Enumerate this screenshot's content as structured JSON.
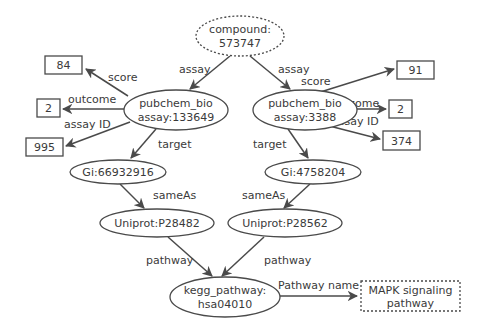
{
  "nodes": {
    "compound": {
      "line1": "compound:",
      "line2": "573747"
    },
    "left_assay": {
      "line1": "pubchem_bio",
      "line2": "assay:133649"
    },
    "right_assay": {
      "line1": "pubchem_bio",
      "line2": "assay:3388"
    },
    "left_score": "84",
    "left_outcome": "2",
    "left_assay_id": "995",
    "right_score": "91",
    "right_outcome": "2",
    "right_assay_id": "374",
    "left_gi": "Gi:66932916",
    "right_gi": "Gi:4758204",
    "left_uniprot": "Uniprot:P28482",
    "right_uniprot": "Uniprot:P28562",
    "kegg": {
      "line1": "kegg_pathway:",
      "line2": "hsa04010"
    },
    "pathway_name": {
      "line1": "MAPK signaling",
      "line2": "pathway"
    }
  },
  "edges": {
    "assay_left": "assay",
    "assay_right": "assay",
    "score_left": "score",
    "outcome_left": "outcome",
    "assay_id_left": "assay ID",
    "score_right": "score",
    "outcome_right": "outcome",
    "assay_id_right": "assay ID",
    "target_left": "target",
    "target_right": "target",
    "same_as_left": "sameAs",
    "same_as_right": "sameAs",
    "pathway_left": "pathway",
    "pathway_right": "pathway",
    "pathway_name": "Pathway name"
  }
}
